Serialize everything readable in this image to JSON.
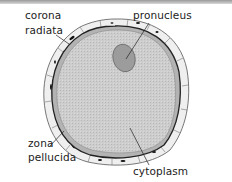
{
  "diagram": {
    "labels": {
      "corona_radiata_line1": "corona",
      "corona_radiata_line2": "radiata",
      "pronucleus": "pronucleus",
      "zona_pellucida_line1": "zona",
      "zona_pellucida_line2": "pellucida",
      "cytoplasm": "cytoplasm"
    },
    "colors": {
      "cytoplasm_fill": "#c9c9c9",
      "pronucleus_fill": "#9a9a9a",
      "zona_fill": "#b5b5b5",
      "corona_cells_fill": "#ececec",
      "outline": "#222222"
    }
  }
}
